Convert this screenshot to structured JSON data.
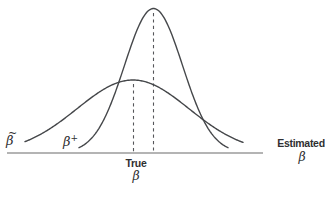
{
  "figure": {
    "width": 325,
    "height": 198,
    "background": "#ffffff",
    "curve_color": "#45474a",
    "axis_color": "#9b9b9b",
    "dash_color": "#55565a",
    "text_color": "#2f2f31"
  },
  "labels": {
    "wide_curve": {
      "base": "β",
      "accent": "~"
    },
    "narrow_curve": {
      "base": "β",
      "superscript": "+"
    },
    "true_axis": {
      "line1": "True",
      "line2": "β"
    },
    "estimated_axis": {
      "line1": "Estimated",
      "line2": "β"
    }
  },
  "geometry": {
    "baseline": {
      "y": 153,
      "x1": 7,
      "x2": 263,
      "width": 1.5
    },
    "curves": [
      {
        "id": "wide-unbiased",
        "mu": 133,
        "sigma": 56,
        "amplitude": 73,
        "x_start": 25,
        "x_end": 243.5
      },
      {
        "id": "narrow-biased",
        "mu": 153.5,
        "sigma": 29,
        "amplitude": 144.5,
        "x_start": 79,
        "x_end": 228
      }
    ],
    "dashed_lines": [
      {
        "id": "true-beta-line",
        "x": 133.5,
        "y1": 84,
        "y2": 151.5
      },
      {
        "id": "biased-peak-line",
        "x": 153.5,
        "y1": 13,
        "y2": 151.5
      }
    ]
  }
}
